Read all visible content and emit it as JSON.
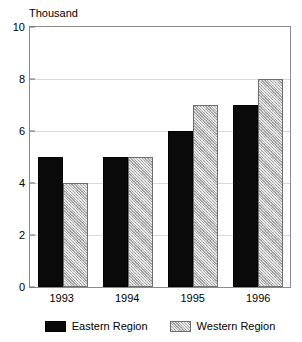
{
  "chart_data": {
    "type": "bar",
    "title": "",
    "xlabel": "",
    "ylabel": "Thousand",
    "categories": [
      "1993",
      "1994",
      "1995",
      "1996"
    ],
    "series": [
      {
        "name": "Eastern Region",
        "values": [
          5,
          5,
          6,
          7
        ],
        "color": "#0a0a0a",
        "fill": "solid-black"
      },
      {
        "name": "Western Region",
        "values": [
          4,
          5,
          7,
          8
        ],
        "color": "#b4b4b4",
        "fill": "gray-crosshatch"
      }
    ],
    "ylim": [
      0,
      10
    ],
    "yticks": [
      0,
      2,
      4,
      6,
      8,
      10
    ],
    "ytick_labels": [
      "0",
      "2",
      "4",
      "6",
      "8",
      "10"
    ],
    "grid": true,
    "grid_axis": "y",
    "legend_position": "bottom-center"
  },
  "axes": {
    "y_unit_caption": "Thousand"
  },
  "legend": {
    "entries": [
      {
        "label": "Eastern Region",
        "swatch": "solid-black"
      },
      {
        "label": "Western Region",
        "swatch": "gray-crosshatch"
      }
    ]
  },
  "colors": {
    "eastern": "#0a0a0a",
    "western": "#b4b4b4",
    "frame": "#8b8b8b",
    "gridline": "#d8d8d8",
    "background": "#ffffff"
  }
}
